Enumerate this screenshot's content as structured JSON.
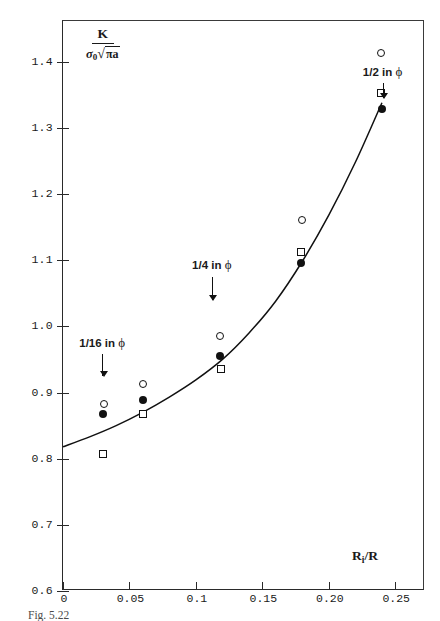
{
  "chart_data": {
    "type": "scatter",
    "title": "",
    "xlabel": "R_i/R",
    "ylabel": "K / (sigma_0 sqrt(pi a))",
    "xlim": [
      0,
      0.2724
    ],
    "ylim": [
      0.6,
      1.4615
    ],
    "grid": false,
    "legend_position": "none",
    "xticks": [
      0,
      0.05,
      0.1,
      0.15,
      0.2,
      0.25
    ],
    "xticklabels": [
      "0",
      "0.05",
      "0.1",
      "0.15",
      "0.20",
      "0.25"
    ],
    "yticks": [
      0.6,
      0.7,
      0.8,
      0.9,
      1.0,
      1.1,
      1.2,
      1.3,
      1.4
    ],
    "yticklabels": [
      "0.6",
      "0.7",
      "0.8",
      "0.9",
      "1.0",
      "1.1",
      "1.2",
      "1.3",
      "1.4"
    ],
    "series": [
      {
        "name": "open-circle",
        "marker": "circle-open",
        "points": [
          {
            "x": 0.0305,
            "y": 0.882
          },
          {
            "x": 0.0605,
            "y": 0.913
          },
          {
            "x": 0.1185,
            "y": 0.985
          },
          {
            "x": 0.1795,
            "y": 1.16
          },
          {
            "x": 0.2395,
            "y": 1.413
          }
        ]
      },
      {
        "name": "filled-circle",
        "marker": "circle-filled",
        "points": [
          {
            "x": 0.03,
            "y": 0.868
          },
          {
            "x": 0.06,
            "y": 0.888
          },
          {
            "x": 0.118,
            "y": 0.955
          },
          {
            "x": 0.179,
            "y": 1.095
          },
          {
            "x": 0.24,
            "y": 1.328
          }
        ]
      },
      {
        "name": "open-square",
        "marker": "square-open",
        "points": [
          {
            "x": 0.03,
            "y": 0.807
          },
          {
            "x": 0.0605,
            "y": 0.868
          },
          {
            "x": 0.119,
            "y": 0.935
          },
          {
            "x": 0.179,
            "y": 1.113
          },
          {
            "x": 0.2395,
            "y": 1.352
          }
        ]
      }
    ],
    "fitted_curve": {
      "name": "fitted-curve",
      "points": [
        {
          "x": 0.0,
          "y": 0.818
        },
        {
          "x": 0.02,
          "y": 0.833
        },
        {
          "x": 0.04,
          "y": 0.85
        },
        {
          "x": 0.06,
          "y": 0.87
        },
        {
          "x": 0.08,
          "y": 0.893
        },
        {
          "x": 0.1,
          "y": 0.919
        },
        {
          "x": 0.12,
          "y": 0.95
        },
        {
          "x": 0.14,
          "y": 0.99
        },
        {
          "x": 0.16,
          "y": 1.038
        },
        {
          "x": 0.18,
          "y": 1.098
        },
        {
          "x": 0.2,
          "y": 1.168
        },
        {
          "x": 0.22,
          "y": 1.248
        },
        {
          "x": 0.24,
          "y": 1.338
        }
      ]
    },
    "annotations": [
      {
        "name": "annotation-1-16-in",
        "label": "1/16 in",
        "symbol": "ϕ",
        "x": 0.0295,
        "y": 0.975,
        "arrow_from_y": 0.958,
        "arrow_to_y": 0.925
      },
      {
        "name": "annotation-1-4-in",
        "label": "1/4 in",
        "symbol": "ϕ",
        "x": 0.112,
        "y": 1.092,
        "arrow_from_y": 1.074,
        "arrow_to_y": 1.04
      },
      {
        "name": "annotation-1-2-in",
        "label": "1/2 in",
        "symbol": "ϕ",
        "x": 0.2405,
        "y": 1.385,
        "arrow_from_y": 1.368,
        "arrow_to_y": 1.345
      }
    ]
  },
  "figure": {
    "ylabel_numerator": "K",
    "ylabel_sigma": "σ",
    "ylabel_sigma_sub": "0",
    "ylabel_radical": "√",
    "ylabel_radicand": "πa",
    "xlabel_main": "R",
    "xlabel_sub": "i",
    "xlabel_rest": "/R",
    "caption": "Fig. 5.22"
  }
}
